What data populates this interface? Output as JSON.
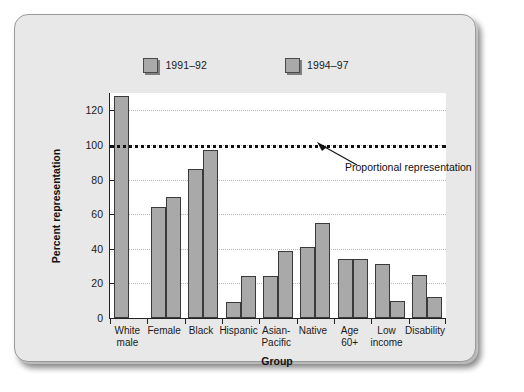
{
  "legend": {
    "items": [
      {
        "label": "1991–92",
        "swatch_color": "#a9a9a9"
      },
      {
        "label": "1994–97",
        "swatch_color": "#a9a9a9"
      }
    ]
  },
  "axes": {
    "y_title": "Percent representation",
    "x_title": "Group",
    "y_ticks": [
      "0",
      "20",
      "40",
      "60",
      "80",
      "100",
      "120"
    ]
  },
  "annotation": {
    "text": "Proportional representation"
  },
  "chart_data": {
    "type": "bar",
    "title": "",
    "xlabel": "Group",
    "ylabel": "Percent representation",
    "ylim": [
      0,
      130
    ],
    "yticks": [
      0,
      20,
      40,
      60,
      80,
      100,
      120
    ],
    "grid": true,
    "legend_position": "top-center",
    "categories": [
      "White male",
      "Female",
      "Black",
      "Hispanic",
      "Asian-Pacific",
      "Native",
      "Age 60+",
      "Low income",
      "Disability"
    ],
    "category_lines": [
      [
        "White",
        "male"
      ],
      [
        "Female"
      ],
      [
        "Black"
      ],
      [
        "Hispanic"
      ],
      [
        "Asian-",
        "Pacific"
      ],
      [
        "Native"
      ],
      [
        "Age 60+"
      ],
      [
        "Low",
        "income"
      ],
      [
        "Disability"
      ]
    ],
    "series": [
      {
        "name": "1991–92",
        "values": [
          128,
          64,
          86,
          9,
          24,
          41,
          34,
          31,
          25
        ]
      },
      {
        "name": "1994–97",
        "values": [
          null,
          70,
          97,
          24,
          39,
          55,
          34,
          10,
          12
        ]
      }
    ],
    "reference_line": {
      "value": 100,
      "label": "Proportional representation",
      "style": "dotted"
    }
  },
  "colors": {
    "bar_fill": "#a9a9a9",
    "bar_stroke": "#3a3a3a",
    "plot_bg": "#ffffff",
    "frame_bg": "#e8e8e8",
    "gridline": "#b9b9b9",
    "axis": "#222222"
  }
}
